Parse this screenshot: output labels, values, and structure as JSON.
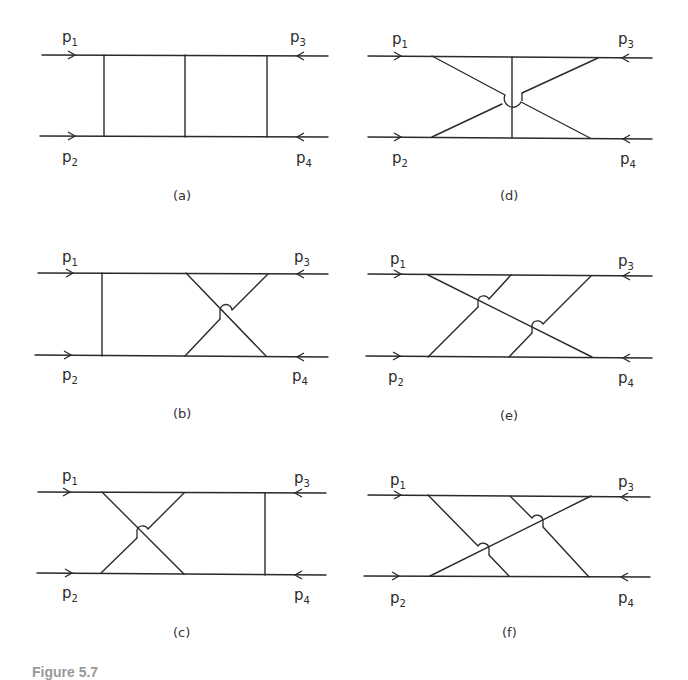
{
  "figure": {
    "caption_fragment": "Figure 5.7",
    "momentum_labels": {
      "p1": {
        "base": "p",
        "sub": "1"
      },
      "p2": {
        "base": "p",
        "sub": "2"
      },
      "p3": {
        "base": "p",
        "sub": "3"
      },
      "p4": {
        "base": "p",
        "sub": "4"
      }
    },
    "panels": [
      {
        "id": "a",
        "label": "(a)",
        "description": "ladder: three parallel rungs"
      },
      {
        "id": "b",
        "label": "(b)",
        "description": "one rung plus crossed pair on right"
      },
      {
        "id": "c",
        "label": "(c)",
        "description": "crossed pair on left plus one rung"
      },
      {
        "id": "d",
        "label": "(d)",
        "description": "two crossed lines with central vertical rung"
      },
      {
        "id": "e",
        "label": "(e)",
        "description": "one long diagonal crossed by two parallel lines"
      },
      {
        "id": "f",
        "label": "(f)",
        "description": "one long diagonal crossed by two parallel lines (mirrored)"
      }
    ]
  }
}
